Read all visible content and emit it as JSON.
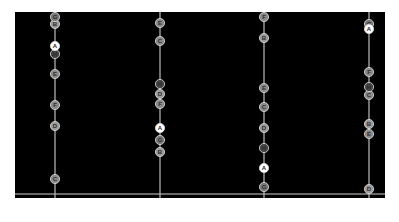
{
  "chart_data": {
    "type": "scatter",
    "subtype": "parallel-coordinates-dot-plot",
    "title": "",
    "xlabel": "",
    "ylabel": "",
    "grid": false,
    "legend": "none",
    "background": "#000000",
    "axes": [
      {
        "name": "Quality",
        "x": 55
      },
      {
        "name": "Time",
        "x": 160
      },
      {
        "name": "Fuel",
        "x": 264
      },
      {
        "name": "Detection",
        "x": 369
      }
    ],
    "y_range_px": [
      12,
      194
    ],
    "series": [
      {
        "name": "A",
        "highlight": true,
        "color": "#ffffff",
        "positions": {
          "Quality": 46,
          "Time": 128,
          "Fuel": 168,
          "Detection": 29
        }
      },
      {
        "name": "B",
        "color": "#9a9a9a",
        "positions": {
          "Quality": 24,
          "Time": 152,
          "Fuel": 38,
          "Detection": 124
        }
      },
      {
        "name": "C",
        "color": "#8a8a8a",
        "positions": {
          "Quality": 179,
          "Time": 41,
          "Fuel": 107,
          "Detection": 95
        }
      },
      {
        "name": "D",
        "color": "#9a9a9a",
        "positions": {
          "Quality": 126,
          "Time": 94,
          "Fuel": 128,
          "Detection": 189
        }
      },
      {
        "name": "E",
        "color": "#8a8a8a",
        "positions": {
          "Quality": 74,
          "Time": 23,
          "Fuel": 88,
          "Detection": 134
        }
      },
      {
        "name": "F",
        "color": "#8a8a8a",
        "positions": {
          "Quality": 105,
          "Time": 104,
          "Fuel": 17,
          "Detection": 72
        }
      },
      {
        "name": "G",
        "color": "#777777",
        "positions": {
          "Quality": 17,
          "Time": 140,
          "Fuel": 187,
          "Detection": 24
        }
      },
      {
        "name": "H",
        "color": "#444444",
        "positions": {
          "Quality": 54,
          "Time": 84,
          "Fuel": 148,
          "Detection": 87
        }
      }
    ]
  }
}
